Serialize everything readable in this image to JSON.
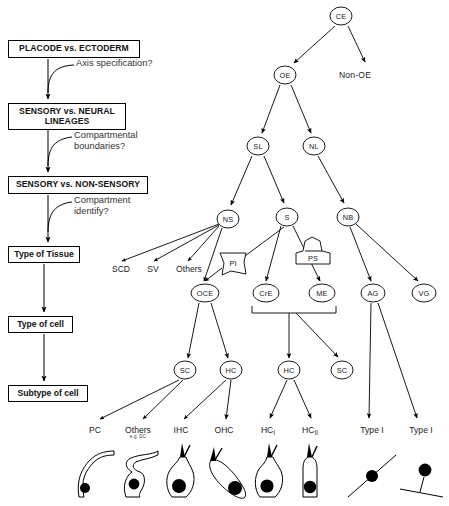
{
  "left_column": {
    "stage_boxes": [
      {
        "id": "placode-ectoderm",
        "label": "PLACODE vs. ECTODERM",
        "x": 8,
        "y": 40,
        "w": 132,
        "h": 18,
        "style": "bold"
      },
      {
        "id": "sensory-neural",
        "label": "SENSORY vs. NEURAL LINEAGES",
        "x": 8,
        "y": 103,
        "w": 118,
        "h": 26,
        "style": "bold"
      },
      {
        "id": "sensory-nonsensory",
        "label": "SENSORY vs. NON-SENSORY",
        "x": 8,
        "y": 176,
        "w": 140,
        "h": 18,
        "style": "bold"
      },
      {
        "id": "type-of-tissue",
        "label": "Type of Tissue",
        "x": 8,
        "y": 246,
        "w": 72,
        "h": 17,
        "style": "plain"
      },
      {
        "id": "type-of-cell",
        "label": "Type of cell",
        "x": 8,
        "y": 316,
        "w": 65,
        "h": 17,
        "style": "plain"
      },
      {
        "id": "subtype-of-cell",
        "label": "Subtype of cell",
        "x": 8,
        "y": 385,
        "w": 80,
        "h": 17,
        "style": "plain"
      }
    ],
    "questions": [
      {
        "id": "axis-specification",
        "label": "Axis specification?",
        "x": 68,
        "y": 64
      },
      {
        "id": "compartmental-boundaries",
        "label": "Compartmental\nboundaries?",
        "x": 62,
        "y": 133
      },
      {
        "id": "compartment-identify",
        "label": "Compartment\nidentify?",
        "x": 62,
        "y": 197
      }
    ]
  },
  "tree": {
    "nodes": [
      {
        "id": "CE",
        "label": "CE",
        "x": 341,
        "y": 16,
        "rx": 11,
        "ry": 9
      },
      {
        "id": "OE",
        "label": "OE",
        "x": 285,
        "y": 75,
        "rx": 11,
        "ry": 9
      },
      {
        "id": "SL",
        "label": "SL",
        "x": 258,
        "y": 146,
        "rx": 11,
        "ry": 9
      },
      {
        "id": "NL",
        "label": "NL",
        "x": 314,
        "y": 146,
        "rx": 11,
        "ry": 9
      },
      {
        "id": "NS",
        "label": "NS",
        "x": 228,
        "y": 219,
        "rx": 11,
        "ry": 9
      },
      {
        "id": "S",
        "label": "S",
        "x": 287,
        "y": 217,
        "rx": 11,
        "ry": 9
      },
      {
        "id": "NB",
        "label": "NB",
        "x": 348,
        "y": 217,
        "rx": 11,
        "ry": 9
      },
      {
        "id": "OCE",
        "label": "OCE",
        "x": 205,
        "y": 293,
        "rx": 14,
        "ry": 9
      },
      {
        "id": "CrE",
        "label": "CrE",
        "x": 266,
        "y": 293,
        "rx": 13,
        "ry": 9
      },
      {
        "id": "ME",
        "label": "ME",
        "x": 322,
        "y": 293,
        "rx": 13,
        "ry": 9
      },
      {
        "id": "AG",
        "label": "AG",
        "x": 373,
        "y": 293,
        "rx": 12,
        "ry": 9
      },
      {
        "id": "VG",
        "label": "VG",
        "x": 424,
        "y": 293,
        "rx": 12,
        "ry": 9
      },
      {
        "id": "SC1",
        "label": "SC",
        "x": 185,
        "y": 370,
        "rx": 11,
        "ry": 9
      },
      {
        "id": "HC1",
        "label": "HC",
        "x": 231,
        "y": 370,
        "rx": 11,
        "ry": 9
      },
      {
        "id": "HC2",
        "label": "HC",
        "x": 289,
        "y": 370,
        "rx": 11,
        "ry": 9
      },
      {
        "id": "SC2",
        "label": "SC",
        "x": 342,
        "y": 370,
        "rx": 11,
        "ry": 9
      }
    ],
    "callouts": [
      {
        "id": "PI",
        "label": "PI",
        "x": 232,
        "y": 263
      },
      {
        "id": "PS",
        "label": "PS",
        "x": 313,
        "y": 258
      }
    ],
    "plain_nodes": [
      {
        "id": "non-oe",
        "label": "Non-OE",
        "x": 355,
        "y": 75
      }
    ],
    "tissue_leaf_labels": [
      {
        "id": "SCD",
        "label": "SCD",
        "x": 121,
        "y": 270
      },
      {
        "id": "SV",
        "label": "SV",
        "x": 153,
        "y": 270
      },
      {
        "id": "Others",
        "label": "Others",
        "x": 189,
        "y": 270
      }
    ],
    "cell_leaves": [
      {
        "id": "PC",
        "label": "PC",
        "sub": "",
        "x": 95,
        "y": 430,
        "cell": "pillar"
      },
      {
        "id": "OthersDC",
        "label": "Others",
        "sub": "e.g. DC",
        "x": 138,
        "y": 430,
        "cell": "deiters"
      },
      {
        "id": "IHC",
        "label": "IHC",
        "sub": "",
        "x": 181,
        "y": 430,
        "cell": "ihc"
      },
      {
        "id": "OHC",
        "label": "OHC",
        "sub": "",
        "x": 224,
        "y": 430,
        "cell": "ohc"
      },
      {
        "id": "HCI",
        "label": "HC",
        "rom": "I",
        "sub": "",
        "x": 268,
        "y": 430,
        "cell": "hc1"
      },
      {
        "id": "HCII",
        "label": "HC",
        "rom": "II",
        "sub": "",
        "x": 310,
        "y": 430,
        "cell": "hc2"
      },
      {
        "id": "TypeI",
        "label": "Type I",
        "sub": "",
        "x": 372,
        "y": 430,
        "cell": "neuron-bipolar"
      },
      {
        "id": "TypeI2",
        "label": "Type I",
        "sub": "",
        "x": 421,
        "y": 430,
        "cell": "neuron-unipolar"
      }
    ]
  },
  "colors": {
    "line": "#000000",
    "text": "#111111",
    "question_text": "#333333",
    "background": "#ffffff"
  }
}
